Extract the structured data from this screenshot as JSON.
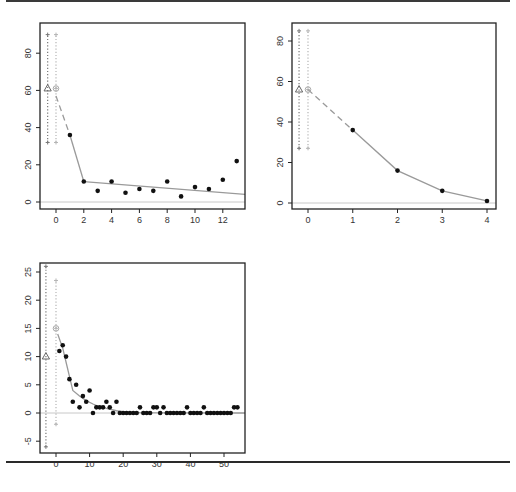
{
  "chart_data": [
    {
      "id": "plot1",
      "type": "scatter",
      "title": "",
      "xlabel": "",
      "ylabel": "",
      "xlim": [
        -0.9,
        13.8
      ],
      "ylim": [
        -4,
        94
      ],
      "xticks": [
        0,
        2,
        4,
        6,
        8,
        10,
        12
      ],
      "yticks": [
        0,
        20,
        40,
        60,
        80
      ],
      "frame": {
        "x0": 40,
        "y0": 23,
        "x1": 245,
        "y1": 209
      },
      "map": {
        "x_at0": 56,
        "x_scale": 13.9,
        "y_at0": 202,
        "y_scale": 1.86
      },
      "points": {
        "x": [
          1,
          2,
          3,
          4,
          5,
          6,
          7,
          8,
          9,
          10,
          11,
          12,
          13
        ],
        "y": [
          36,
          11,
          6,
          11,
          5,
          7,
          6,
          11,
          3,
          8,
          7,
          12,
          22
        ]
      },
      "fit_line": {
        "x": [
          2,
          13.8
        ],
        "y": [
          11,
          4
        ]
      },
      "fit_curve": {
        "x": [
          1,
          2
        ],
        "y": [
          36,
          11
        ]
      },
      "dashed_segment": {
        "x": [
          0,
          1
        ],
        "y": [
          57,
          36
        ]
      },
      "triangle_marker": {
        "x": -0.6,
        "y": 61,
        "interval": [
          32,
          90
        ]
      },
      "circle_marker": {
        "x": 0,
        "y": 61,
        "interval": [
          32,
          90
        ]
      },
      "zero_line": 0
    },
    {
      "id": "plot2",
      "type": "line",
      "title": "",
      "xlabel": "",
      "ylabel": "",
      "xlim": [
        -0.35,
        4.2
      ],
      "ylim": [
        -3,
        90
      ],
      "xticks": [
        0,
        1,
        2,
        3,
        4
      ],
      "yticks": [
        0,
        20,
        40,
        60,
        80
      ],
      "frame": {
        "x0": 292,
        "y0": 23,
        "x1": 496,
        "y1": 209
      },
      "map": {
        "x_at0": 308,
        "x_scale": 44.75,
        "y_at0": 203,
        "y_scale": 2.025
      },
      "points": {
        "x": [
          1,
          2,
          3,
          4
        ],
        "y": [
          36,
          16,
          6,
          1
        ]
      },
      "dashed_segment": {
        "x": [
          0,
          1
        ],
        "y": [
          56,
          36
        ]
      },
      "triangle_marker": {
        "x": -0.2,
        "y": 56,
        "interval": [
          27,
          85
        ]
      },
      "circle_marker": {
        "x": 0,
        "y": 56,
        "interval": [
          27,
          85
        ]
      },
      "zero_line": 0
    },
    {
      "id": "plot3",
      "type": "scatter",
      "title": "",
      "xlabel": "",
      "ylabel": "",
      "xlim": [
        -4.5,
        56.5
      ],
      "ylim": [
        -7,
        27
      ],
      "xticks": [
        0,
        10,
        20,
        30,
        40,
        50
      ],
      "yticks": [
        -5,
        0,
        5,
        10,
        15,
        20,
        25
      ],
      "frame": {
        "x0": 40,
        "y0": 263,
        "x1": 245,
        "y1": 453
      },
      "map": {
        "x_at0": 56,
        "x_scale": 3.36,
        "y_at0": 413,
        "y_scale": 5.64
      },
      "points": {
        "x": [
          1,
          2,
          3,
          4,
          5,
          6,
          7,
          8,
          9,
          10,
          11,
          12,
          13,
          14,
          15,
          16,
          17,
          18,
          19,
          20,
          21,
          22,
          23,
          24,
          25,
          26,
          27,
          28,
          29,
          30,
          31,
          32,
          33,
          34,
          35,
          36,
          37,
          38,
          39,
          40,
          41,
          42,
          43,
          44,
          45,
          46,
          47,
          48,
          49,
          50,
          51,
          52,
          53,
          54
        ],
        "y": [
          11,
          12,
          10,
          6,
          2,
          5,
          1,
          3,
          2,
          4,
          0,
          1,
          1,
          1,
          2,
          1,
          0,
          2,
          0,
          0,
          0,
          0,
          0,
          0,
          1,
          0,
          0,
          0,
          1,
          1,
          0,
          1,
          0,
          0,
          0,
          0,
          0,
          0,
          1,
          0,
          0,
          0,
          0,
          1,
          0,
          0,
          0,
          0,
          0,
          0,
          0,
          0,
          1,
          1
        ]
      },
      "fit_curve": {
        "x": [
          0.5,
          2,
          3,
          4,
          5,
          7,
          9,
          11,
          13,
          15,
          18,
          21,
          25,
          56.5
        ],
        "y": [
          14,
          11.5,
          9,
          6.5,
          4,
          3,
          2.2,
          1.6,
          1.1,
          0.8,
          0.4,
          0.15,
          0.05,
          0
        ]
      },
      "triangle_marker": {
        "x": -3,
        "y": 10,
        "interval": [
          -6,
          26
        ]
      },
      "circle_marker": {
        "x": 0,
        "y": 15,
        "interval": [
          -2,
          23.5
        ]
      },
      "zero_line": 0
    }
  ],
  "colors": {
    "frame": "#222222",
    "point": "#111111",
    "fit_line": "#9a9a9a",
    "zero_line": "#c8c8c8",
    "triangle_interval": "#777777",
    "circle_interval": "#b4b4b4",
    "triangle_marker": "#666666",
    "circle_marker": "#a8a8a8"
  }
}
